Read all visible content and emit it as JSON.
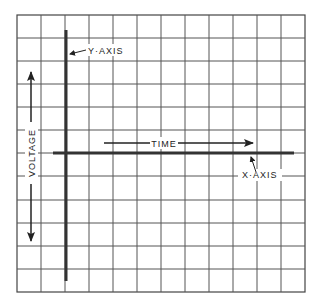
{
  "diagram": {
    "labels": {
      "y_axis": "Y·AXIS",
      "x_axis": "X·AXIS",
      "time": "TIME",
      "voltage": "VOLTAGE"
    },
    "grid": {
      "columns": 12,
      "rows": 12
    },
    "colors": {
      "grid": "#555555",
      "axis": "#333333",
      "background": "#ffffff"
    }
  }
}
